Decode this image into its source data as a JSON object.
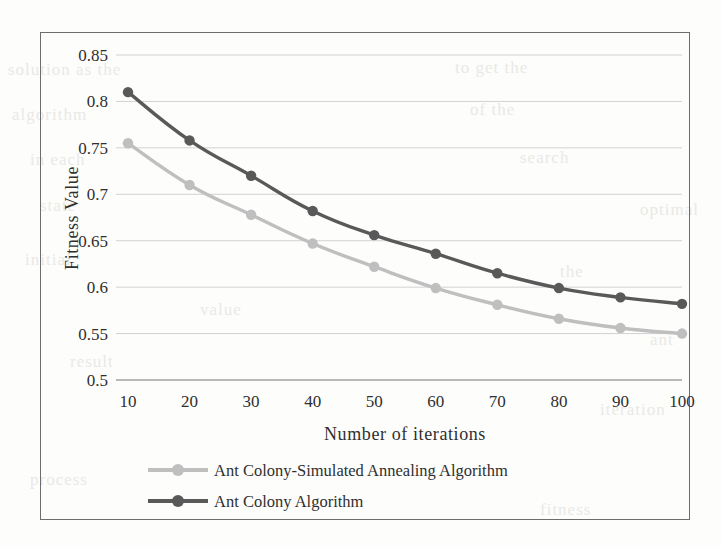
{
  "figure": {
    "frame_color": "#6d6d6d",
    "background": "#fdfdfc"
  },
  "chart_data": {
    "type": "line",
    "title": "",
    "xlabel": "Number of iterations",
    "ylabel": "Fitness Value",
    "x": [
      10,
      20,
      30,
      40,
      50,
      60,
      70,
      80,
      90,
      100
    ],
    "xtick_labels": [
      "10",
      "20",
      "30",
      "40",
      "50",
      "60",
      "70",
      "80",
      "90",
      "100"
    ],
    "ytick_labels": [
      "0.5",
      "0.55",
      "0.6",
      "0.65",
      "0.7",
      "0.75",
      "0.8",
      "0.85"
    ],
    "yticks": [
      0.5,
      0.55,
      0.6,
      0.65,
      0.7,
      0.75,
      0.8,
      0.85
    ],
    "ylim": [
      0.5,
      0.85
    ],
    "xlim": [
      10,
      100
    ],
    "grid": true,
    "grid_axis": "y",
    "legend_position": "below-axis",
    "series": [
      {
        "name": "Ant Colony-Simulated Annealing Algorithm",
        "color": "#bfbfbf",
        "marker": "circle",
        "values": [
          0.755,
          0.71,
          0.678,
          0.647,
          0.622,
          0.599,
          0.581,
          0.566,
          0.556,
          0.55
        ]
      },
      {
        "name": "Ant Colony Algorithm",
        "color": "#595959",
        "marker": "circle",
        "values": [
          0.81,
          0.758,
          0.72,
          0.682,
          0.656,
          0.636,
          0.615,
          0.599,
          0.589,
          0.582
        ]
      }
    ]
  },
  "legend": {
    "entries": [
      {
        "label": "Ant Colony-Simulated Annealing Algorithm",
        "color": "#bfbfbf"
      },
      {
        "label": "Ant Colony Algorithm",
        "color": "#595959"
      }
    ]
  },
  "bleed_text": {
    "lines": [
      {
        "text": "solution as the",
        "x": 8,
        "y": 60
      },
      {
        "text": "to get the",
        "x": 455,
        "y": 58
      },
      {
        "text": "algorithm",
        "x": 12,
        "y": 105
      },
      {
        "text": "of the",
        "x": 470,
        "y": 100
      },
      {
        "text": "in each",
        "x": 30,
        "y": 150
      },
      {
        "text": "search",
        "x": 520,
        "y": 148
      },
      {
        "text": "state",
        "x": 40,
        "y": 196
      },
      {
        "text": "initial",
        "x": 25,
        "y": 250
      },
      {
        "text": "value",
        "x": 200,
        "y": 300
      },
      {
        "text": "the",
        "x": 560,
        "y": 262
      },
      {
        "text": "result",
        "x": 70,
        "y": 352
      },
      {
        "text": "iteration",
        "x": 600,
        "y": 400
      },
      {
        "text": "process",
        "x": 30,
        "y": 470
      },
      {
        "text": "fitness",
        "x": 540,
        "y": 500
      },
      {
        "text": "optimal",
        "x": 640,
        "y": 200
      },
      {
        "text": "ant",
        "x": 650,
        "y": 330
      }
    ]
  }
}
